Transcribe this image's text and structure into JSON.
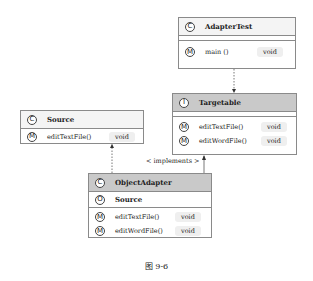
{
  "classes": {
    "adapter_test": {
      "icon": "C",
      "name": "AdapterTest",
      "methods": [
        {
          "icon": "M",
          "name": "main ()",
          "type": "void"
        }
      ]
    },
    "targetable": {
      "icon": "I",
      "name": "Targetable",
      "methods": [
        {
          "icon": "M",
          "name": "editTextFile()",
          "type": "void"
        },
        {
          "icon": "M",
          "name": "editWordFile()",
          "type": "void"
        }
      ]
    },
    "source": {
      "icon": "C",
      "name": "Source",
      "methods": [
        {
          "icon": "M",
          "name": "editTextFile()",
          "type": "void"
        }
      ]
    },
    "object_adapter": {
      "icon": "C",
      "name": "ObjectAdapter",
      "fields": [
        {
          "icon": "O",
          "name": "Source"
        }
      ],
      "methods": [
        {
          "icon": "M",
          "name": "editTextFile()",
          "type": "void"
        },
        {
          "icon": "M",
          "name": "editWordFile()",
          "type": "void"
        }
      ]
    }
  },
  "relations": {
    "implements_label": "< implements >"
  },
  "caption": "图 9-6"
}
